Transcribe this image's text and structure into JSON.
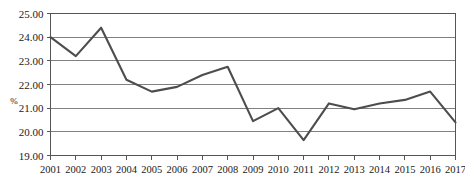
{
  "chart_data": {
    "type": "line",
    "title": "",
    "xlabel": "",
    "ylabel": "%",
    "ylim": [
      19.0,
      25.0
    ],
    "ytick_labels": [
      "25.00",
      "24.00",
      "23.00",
      "22.00",
      "21.00",
      "20.00",
      "19.00"
    ],
    "ytick_values": [
      25.0,
      24.0,
      23.0,
      22.0,
      21.0,
      20.0,
      19.0
    ],
    "grid": true,
    "legend": "none",
    "categories": [
      "2001",
      "2002",
      "2003",
      "2004",
      "2005",
      "2006",
      "2007",
      "2008",
      "2009",
      "2010",
      "2011",
      "2012",
      "2013",
      "2014",
      "2015",
      "2016",
      "2017"
    ],
    "x": [
      2001,
      2002,
      2003,
      2004,
      2005,
      2006,
      2007,
      2008,
      2009,
      2010,
      2011,
      2012,
      2013,
      2014,
      2015,
      2016,
      2017
    ],
    "values": [
      24.0,
      23.2,
      24.4,
      22.2,
      21.7,
      21.9,
      22.4,
      22.75,
      20.45,
      21.0,
      19.65,
      21.2,
      20.95,
      21.2,
      21.35,
      21.7,
      20.4
    ],
    "series": [
      {
        "name": "%",
        "color": "#4d4d4d",
        "values": [
          24.0,
          23.2,
          24.4,
          22.2,
          21.7,
          21.9,
          22.4,
          22.75,
          20.45,
          21.0,
          19.65,
          21.2,
          20.95,
          21.2,
          21.35,
          21.7,
          20.4
        ]
      }
    ]
  },
  "colors": {
    "line": "#4d4d4d",
    "grid": "#808080",
    "frame": "#555555",
    "text": "#1a1a1a",
    "background": "#ffffff"
  }
}
